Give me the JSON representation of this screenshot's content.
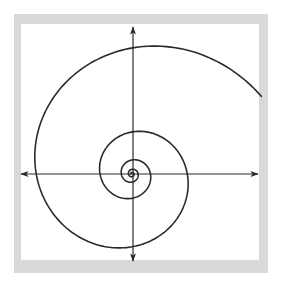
{
  "diagram": {
    "type": "logarithmic-spiral-on-axes",
    "colors": {
      "frame": "#d9d9d9",
      "background": "#ffffff",
      "stroke": "#2a2a2a"
    },
    "axes": {
      "origin": [
        133,
        174
      ],
      "x_axis": {
        "from": [
          21,
          174
        ],
        "to": [
          258,
          174
        ],
        "arrows": "both"
      },
      "y_axis": {
        "from": [
          133,
          27
        ],
        "to": [
          133,
          261
        ],
        "arrows": "both"
      }
    },
    "spiral": {
      "center": [
        132,
        174
      ],
      "reference_radius": 126,
      "reference_angle_deg": 90,
      "quarter_turn_ratio": 0.76,
      "start_angle_deg": 31,
      "end_angle_deg": 1700,
      "direction": "counterclockwise-inward"
    }
  }
}
